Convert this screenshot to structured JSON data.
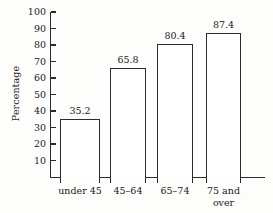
{
  "chart_data": {
    "type": "bar",
    "title": "",
    "xlabel": "",
    "ylabel": "Percentage",
    "categories": [
      "under 45",
      "45–64",
      "65–74",
      "75 and\nover"
    ],
    "values": [
      35.2,
      65.8,
      80.4,
      87.4
    ],
    "value_labels": [
      "35.2",
      "65.8",
      "80.4",
      "87.4"
    ],
    "ylim": [
      0,
      100
    ],
    "ytick_values": [
      10,
      20,
      30,
      40,
      50,
      60,
      70,
      80,
      90,
      100
    ],
    "ytick_labels": [
      "10",
      "20",
      "30",
      "40",
      "50",
      "60",
      "70",
      "80",
      "90",
      "100"
    ],
    "grid": false,
    "legend": false,
    "bar_fill_color": "#ffffff",
    "bar_edge_color": "#2b2b2b",
    "axis_color": "#2b2b2b",
    "background_color": "#fdfdfc"
  }
}
